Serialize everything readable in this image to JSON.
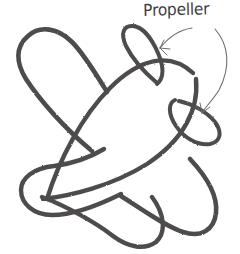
{
  "figure": {
    "kind": "hand-drawn-pencil-sketch",
    "background_color": "#ffffff",
    "stroke_color": "#4d4c4c",
    "thin_stroke_color": "#6e6d6d",
    "canvas": {
      "width": 240,
      "height": 254
    }
  },
  "annotations": [
    {
      "id": "propeller-label",
      "text": "Propeller",
      "x": 143,
      "y": 1,
      "leader_count": 2,
      "leader_targets": [
        "upper-propeller-loop",
        "right-propeller-loop"
      ]
    }
  ],
  "shapes": {
    "upper_left_wing": {
      "name": "upper-left-wing",
      "path": "M 107 92 C 96 74 84 54 72 42 C 58 28 40 26 28 36 C 16 46 16 62 26 78 C 38 98 64 128 92 150",
      "stroke_width": 4.6
    },
    "lower_left_wing": {
      "name": "lower-left-wing",
      "path": "M 103 150 C 88 158 70 164 54 166 C 34 168 22 178 22 190 C 22 204 34 214 52 214 C 70 214 96 206 120 194",
      "stroke_width": 4.4
    },
    "fuselage_upper": {
      "name": "fuselage-upper-curve",
      "path": "M 48 198 C 60 160 82 116 110 88 C 138 60 168 52 192 72",
      "stroke_width": 4.4
    },
    "fuselage_lower": {
      "name": "fuselage-lower-curve",
      "path": "M 44 198 C 70 196 112 186 146 164 C 182 140 198 110 196 80",
      "stroke_width": 4.4
    },
    "tail_loop": {
      "name": "tail-loop",
      "path": "M 42 196 C 66 206 94 222 112 236 C 128 248 144 250 155 242 C 166 232 164 214 152 198",
      "stroke_width": 4.4
    },
    "nose_loop": {
      "name": "nose-loop",
      "path": "M 120 196 C 142 210 164 226 182 232 C 200 238 214 230 216 214 C 218 196 206 176 190 160",
      "stroke_width": 4.6
    },
    "upper_propeller": {
      "name": "upper-propeller-loop",
      "path": "M 156 82 C 144 72 132 58 126 46 C 120 34 124 26 132 26 C 142 26 152 38 158 52 C 164 66 164 78 158 84",
      "stroke_width": 4.0
    },
    "right_propeller": {
      "name": "right-propeller-loop",
      "path": "M 178 100 C 192 104 206 112 214 122 C 222 132 220 142 210 144 C 198 146 184 138 176 126 C 168 114 168 104 174 100",
      "stroke_width": 4.0
    }
  },
  "leaders": {
    "leader_one": {
      "name": "leader-line-upper",
      "path": "M 191 28 C 178 30 168 38 160 48",
      "arrow": "M 160 48 L 169 48 M 160 48 L 163 41"
    },
    "leader_two": {
      "name": "leader-line-right",
      "path": "M 214 28 C 228 44 230 66 218 90 C 212 100 206 106 202 112",
      "arrow": "M 202 112 L 200 103 M 202 112 L 209 107"
    }
  }
}
